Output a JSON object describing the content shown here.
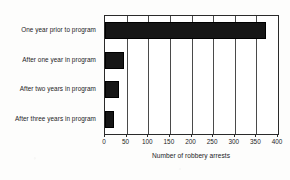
{
  "chart_data": {
    "type": "bar",
    "orientation": "horizontal",
    "title": "",
    "xlabel": "Number of robbery arrests",
    "ylabel": "",
    "categories": [
      "One year prior to program",
      "After one year in program",
      "After two years in program",
      "After three years in program"
    ],
    "values": [
      372,
      44,
      32,
      20
    ],
    "xlim": [
      0,
      400
    ],
    "xticks": [
      0,
      50,
      100,
      150,
      200,
      250,
      300,
      350,
      400
    ],
    "xtick_labels": [
      "0",
      "50",
      "100",
      "150",
      "200",
      "250",
      "300",
      "350",
      "400"
    ],
    "grid": "vertical",
    "legend": "none",
    "bar_color": "#161616",
    "plot_background": "#ffffff",
    "axis_color": "#2a2a2a"
  }
}
